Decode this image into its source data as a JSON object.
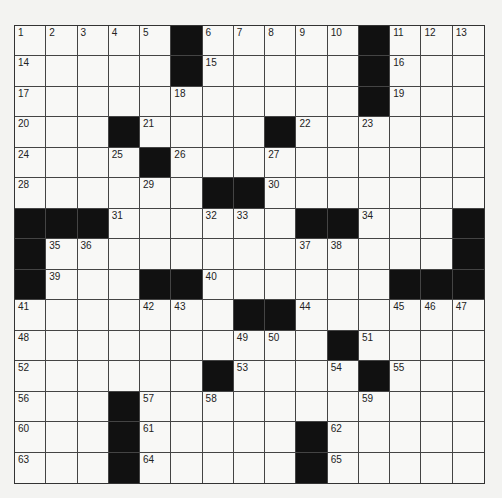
{
  "puzzle": {
    "rows": 15,
    "cols": 15,
    "colors": {
      "background": "#f3f3f1",
      "cell": "#f8f8f6",
      "block": "#111111",
      "line": "#444444"
    },
    "layout": [
      "1,2,3,4,5,#,6,7,8,9,10,#,11,12,13",
      "14,.,.,.,.,#,15,.,.,.,.,#,16,.,.",
      "17,.,.,.,.,18,.,.,.,.,.,#,19,.,.",
      "20,.,.,#,21,.,.,.,#,22,.,23,.,.,.",
      "24,.,.,25,#,26,.,.,27,.,.,.,.,.,.",
      "28,.,.,.,29,.,#,#,30,.,.,.,.,.,.",
      "#,#,#,31,.,.,32,33,.,#,#,34,.,.,#",
      "#,35,36,.,.,.,.,.,.,37,38,.,.,.,#",
      "#,39,.,.,#,#,40,.,.,.,.,.,#,#,#",
      "41,.,.,.,42,43,.,#,#,44,.,.,45,46,47",
      "48,.,.,.,.,.,.,49,50,.,#,51,.,.,.",
      "52,.,.,.,.,.,#,53,.,.,54,#,55,.,.",
      "56,.,.,#,57,.,58,.,.,.,.,59,.,.,.",
      "60,.,.,#,61,.,.,.,.,#,62,.,.,.,.",
      "63,.,.,#,64,.,.,.,.,#,65,.,.,.,."
    ]
  }
}
